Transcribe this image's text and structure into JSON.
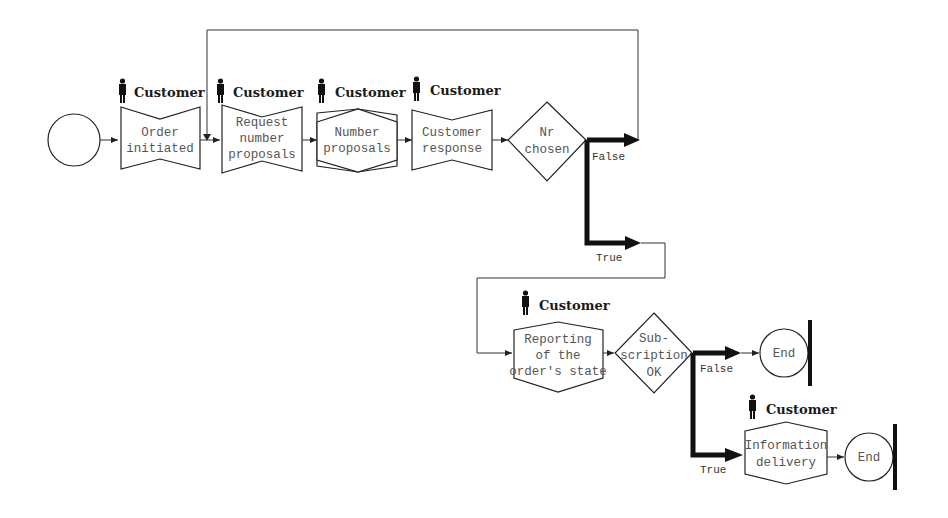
{
  "diagram": {
    "type": "process-flow",
    "role_label": "Customer",
    "colors": {
      "line": "#222222",
      "text": "#555555",
      "label": "#1a1a1a",
      "background": "#ffffff"
    },
    "start": {
      "label": ""
    },
    "nodes": {
      "order_initiated": {
        "lines": [
          "Order",
          "initiated"
        ],
        "shape": "bowtie",
        "role": "Customer"
      },
      "request_number_proposals": {
        "lines": [
          "Request",
          "number",
          "proposals"
        ],
        "shape": "bowtie",
        "role": "Customer"
      },
      "number_proposals": {
        "lines": [
          "Number",
          "proposals"
        ],
        "shape": "hexagon",
        "role": "Customer"
      },
      "customer_response": {
        "lines": [
          "Customer",
          "response"
        ],
        "shape": "bowtie",
        "role": "Customer"
      },
      "nr_chosen": {
        "lines": [
          "Nr",
          "chosen"
        ],
        "shape": "diamond"
      },
      "reporting_state": {
        "lines": [
          "Reporting",
          "of the",
          "order's state"
        ],
        "shape": "hexagon",
        "role": "Customer"
      },
      "subscription_ok": {
        "lines": [
          "Sub-",
          "scription",
          "OK"
        ],
        "shape": "diamond"
      },
      "end_1": {
        "label": "End",
        "shape": "end"
      },
      "information_delivery": {
        "lines": [
          "Information",
          "delivery"
        ],
        "shape": "hexagon",
        "role": "Customer"
      },
      "end_2": {
        "label": "End",
        "shape": "end"
      }
    },
    "branches": {
      "nr_chosen_false": "False",
      "nr_chosen_true": "True",
      "subscription_false": "False",
      "subscription_true": "True"
    }
  }
}
